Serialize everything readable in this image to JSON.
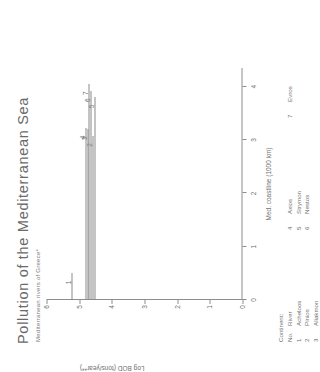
{
  "title": "Pollution of the Mediterranean Sea",
  "subtitle": "Mediterranean rivers of Greece*",
  "axes": {
    "x_title": "Med. coastline (1000 km)",
    "y_title": "Log BOD (tons/year**)",
    "x_ticks": [
      "0",
      "1",
      "2",
      "3",
      "4"
    ],
    "y_ticks": [
      "0",
      "1",
      "2",
      "3",
      "4",
      "5",
      "6"
    ]
  },
  "legend": {
    "continent_header": "Continent:",
    "no_header": "No.",
    "river_header": "River",
    "entries": [
      {
        "no": "1",
        "river": "Acheloos"
      },
      {
        "no": "2",
        "river": "Pinios"
      },
      {
        "no": "3",
        "river": "Aliakmon"
      },
      {
        "no": "4",
        "river": "Axios"
      },
      {
        "no": "5",
        "river": "Strymon"
      },
      {
        "no": "6",
        "river": "Nestos"
      },
      {
        "no": "7",
        "river": "Evros"
      }
    ]
  },
  "chart_data": {
    "type": "bar",
    "orientation": "horizontal",
    "title": "Pollution of the Mediterranean Sea",
    "subtitle": "Mediterranean rivers of Greece*",
    "xlabel": "Med. coastline (1000 km)",
    "ylabel": "Log BOD (tons/year**)",
    "xlim": [
      0,
      4.35
    ],
    "ylim": [
      0,
      6
    ],
    "grid": false,
    "legend_position": "below-plot",
    "categories": [
      "Acheloos",
      "Pinios",
      "Aliakmon",
      "Axios",
      "Strymon",
      "Nestos",
      "Evros"
    ],
    "point_labels": [
      "1",
      "2",
      "3",
      "4",
      "5",
      "6",
      "7"
    ],
    "coastline_position": [
      0.5,
      3.08,
      3.2,
      3.22,
      3.8,
      3.92,
      4.05
    ],
    "values": [
      5.25,
      4.58,
      4.74,
      4.8,
      4.54,
      4.65,
      4.72
    ],
    "note": "Each horizontal line spans from the y-axis to the river's Mediterranean coastline position; the line's vertical placement encodes Log BOD."
  }
}
